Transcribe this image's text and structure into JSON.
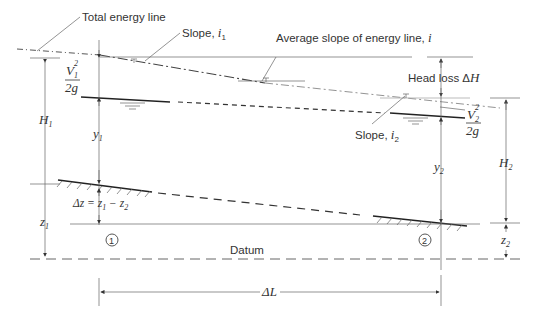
{
  "diagram": {
    "type": "open-channel gradually varied flow energy diagram",
    "labels": {
      "total_energy_line": "Total energy line",
      "slope_i1": "Slope, ",
      "slope_i1_sym": "i",
      "slope_i1_sub": "1",
      "avg_slope": "Average slope of energy line, ",
      "avg_slope_sym": "i",
      "head_loss": "Head loss Δ",
      "head_loss_sym": "H",
      "slope_i2": "Slope, ",
      "slope_i2_sym": "i",
      "slope_i2_sub": "2",
      "v1_num": "V",
      "v1_sub": "1",
      "v1_sup": "2",
      "v1_den": "2g",
      "v2_num": "V",
      "v2_sub": "2",
      "v2_sup": "2",
      "v2_den": "2g",
      "H1": "H",
      "H1_sub": "1",
      "H2": "H",
      "H2_sub": "2",
      "y1": "y",
      "y1_sub": "1",
      "y2": "y",
      "y2_sub": "2",
      "z1": "z",
      "z1_sub": "1",
      "z2": "z",
      "z2_sub": "2",
      "delta_z": "Δz = z",
      "delta_z_sub1": "1",
      "delta_z_mid": " − z",
      "delta_z_sub2": "2",
      "section1": "1",
      "section2": "2",
      "datum": "Datum",
      "delta_L": "ΔL"
    }
  }
}
